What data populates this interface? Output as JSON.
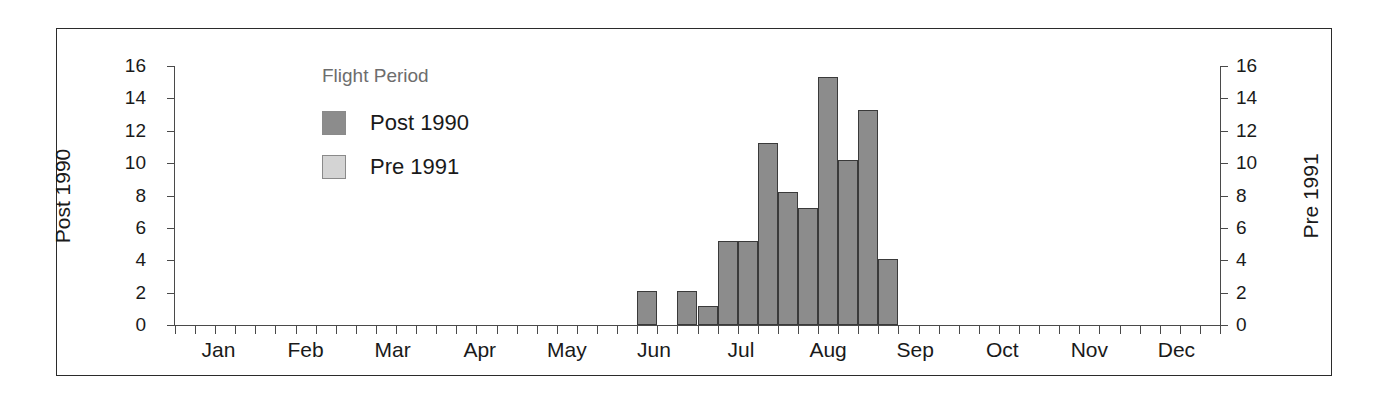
{
  "chart_data": {
    "type": "bar",
    "title": "",
    "subtitle": "",
    "xlabel": "",
    "ylabel": "Post 1990",
    "y2label": "Pre 1991",
    "ylim": [
      0,
      16
    ],
    "y2lim": [
      0,
      16
    ],
    "grid": false,
    "legend_position": "inside-top-left",
    "legend_title": "Flight Period",
    "yticks": [
      "0",
      "2",
      "4",
      "6",
      "8",
      "10",
      "12",
      "14",
      "16"
    ],
    "ytick_values": [
      0,
      2,
      4,
      6,
      8,
      10,
      12,
      14,
      16
    ],
    "y2ticks": [
      "0",
      "2",
      "4",
      "6",
      "8",
      "10",
      "12",
      "14",
      "16"
    ],
    "y2tick_values": [
      0,
      2,
      4,
      6,
      8,
      10,
      12,
      14,
      16
    ],
    "categories": [
      "Jan",
      "Feb",
      "Mar",
      "Apr",
      "May",
      "Jun",
      "Jul",
      "Aug",
      "Sep",
      "Oct",
      "Nov",
      "Dec"
    ],
    "xtick_labels": [
      "Jan",
      "Feb",
      "Mar",
      "Apr",
      "May",
      "Jun",
      "Jul",
      "Aug",
      "Sep",
      "Oct",
      "Nov",
      "Dec"
    ],
    "xtick_minor_count": 52,
    "series": [
      {
        "name": "Post 1990",
        "color": "#8c8c8c",
        "bins": [
          {
            "bin_index": 23,
            "bin_label": "early Jun",
            "value": 2.1
          },
          {
            "bin_index": 25,
            "bin_label": "late Jun",
            "value": 2.1
          },
          {
            "bin_index": 26,
            "bin_label": "end Jun",
            "value": 1.15
          },
          {
            "bin_index": 27,
            "bin_label": "early Jul",
            "value": 5.2
          },
          {
            "bin_index": 28,
            "bin_label": "mid Jul",
            "value": 5.2
          },
          {
            "bin_index": 29,
            "bin_label": "late Jul",
            "value": 11.25
          },
          {
            "bin_index": 30,
            "bin_label": "end Jul",
            "value": 8.2
          },
          {
            "bin_index": 31,
            "bin_label": "early Aug",
            "value": 7.2
          },
          {
            "bin_index": 32,
            "bin_label": "mid Aug",
            "value": 15.3
          },
          {
            "bin_index": 33,
            "bin_label": "late Aug",
            "value": 10.2
          },
          {
            "bin_index": 34,
            "bin_label": "end Aug",
            "value": 13.3
          },
          {
            "bin_index": 35,
            "bin_label": "early Sep",
            "value": 4.1
          }
        ]
      },
      {
        "name": "Pre 1991",
        "color": "#d4d4d4",
        "bins": []
      }
    ]
  },
  "legend": {
    "title": "Flight Period",
    "items": [
      {
        "label": "Post 1990",
        "color": "#8c8c8c"
      },
      {
        "label": "Pre 1991",
        "color": "#d4d4d4"
      }
    ]
  },
  "axes": {
    "left_title": "Post 1990",
    "right_title": "Pre 1991"
  },
  "colors": {
    "bar_post_1990": "#8c8c8c",
    "bar_pre_1991": "#d4d4d4",
    "axis": "#4a4a4a",
    "text": "#1a1a1a",
    "legend_title": "#6d6d6d",
    "frame": "#2b2b2b",
    "background": "#ffffff"
  }
}
